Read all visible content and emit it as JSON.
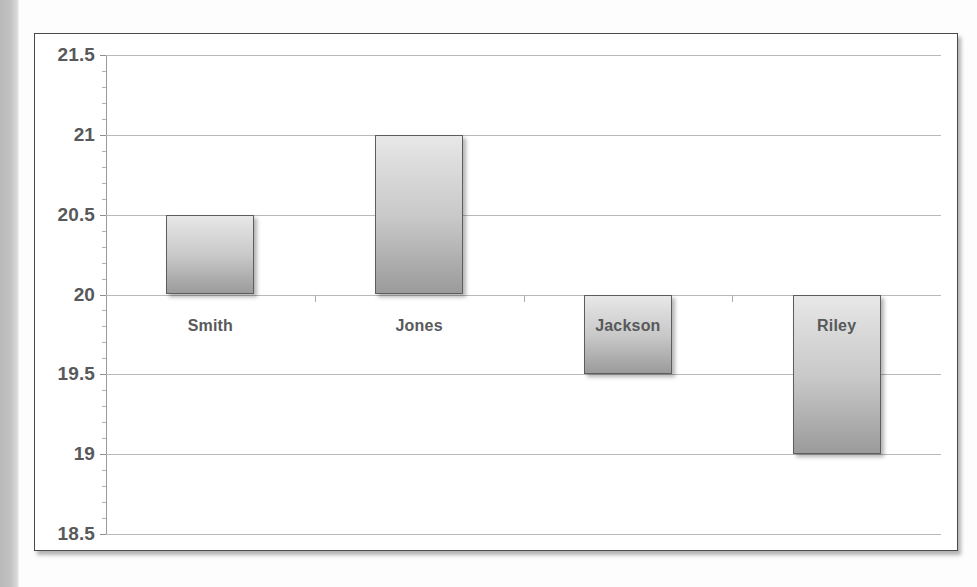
{
  "chart_data": {
    "type": "bar",
    "title": "",
    "subtitle": "",
    "xlabel": "",
    "ylabel": "",
    "categories": [
      "Smith",
      "Jones",
      "Jackson",
      "Riley"
    ],
    "values": [
      20.5,
      21,
      19.5,
      19
    ],
    "baseline": 20,
    "ylim": [
      18.5,
      21.5
    ],
    "y_ticks": [
      "21.5",
      "21",
      "20.5",
      "20",
      "19.5",
      "19",
      "18.5"
    ],
    "y_tick_values": [
      21.5,
      21,
      20.5,
      20,
      19.5,
      19,
      18.5
    ],
    "y_minor_step": 0.1,
    "grid": true,
    "legend": "none",
    "series": [
      {
        "name": "",
        "points": [
          {
            "category": "Smith",
            "value": 20.5,
            "direction": "up"
          },
          {
            "category": "Jones",
            "value": 21,
            "direction": "up"
          },
          {
            "category": "Jackson",
            "value": 19.5,
            "direction": "down"
          },
          {
            "category": "Riley",
            "value": 19,
            "direction": "down"
          }
        ]
      }
    ],
    "colors": {
      "bar_top": "#e8e8e8",
      "bar_bottom": "#9b9b9b",
      "bar_border": "#5d5d5d",
      "gridline": "#b9b9b9",
      "text": "#58595b",
      "frame_border": "#4a4a4a",
      "plot_background": "#ffffff"
    }
  }
}
